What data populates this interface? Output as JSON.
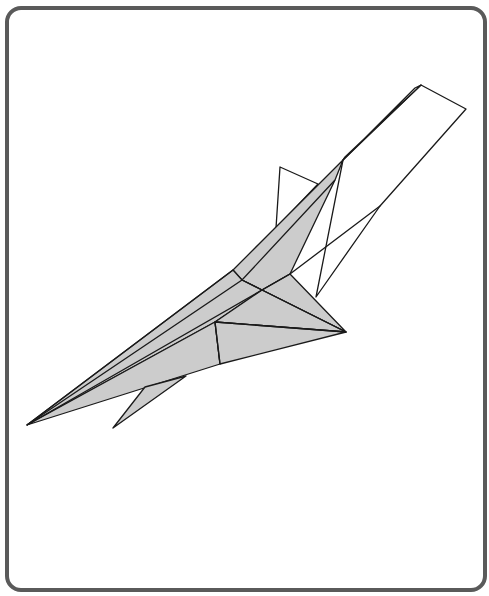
{
  "figure": {
    "type": "origami-fold-diagram",
    "colors": {
      "frame": "#5a5a5a",
      "paper_fill": "#cccccc",
      "paper_back": "#ffffff",
      "line": "#1a1a1a",
      "background": "#ffffff"
    },
    "stroke_width": 1.3,
    "shapes": [
      {
        "name": "tail-flap-outline",
        "fill": "#ffffff",
        "points": "343,160 421,85 466,109 380,206 316,297"
      },
      {
        "name": "tail-strip-inner",
        "fill": "#ffffff",
        "points": "343,160 415,88 421,85 345,157"
      },
      {
        "name": "vertical-fin",
        "fill": "#ffffff",
        "points": "280,167 318,184 276,228"
      },
      {
        "name": "lower-fin-line",
        "fill": "none",
        "points": "290,274 380,206"
      },
      {
        "name": "upper-wing",
        "fill": "#cccccc",
        "points": "343,160 335,180 290,274 262,290 242,280 233,270 275,228"
      },
      {
        "name": "body-upper",
        "fill": "#cccccc",
        "points": "233,270 242,280 262,290 215,322 27,425"
      },
      {
        "name": "rear-wing",
        "fill": "#cccccc",
        "points": "262,290 290,274 346,332 262,290"
      },
      {
        "name": "mid-panel",
        "fill": "#cccccc",
        "points": "262,290 346,332 215,322"
      },
      {
        "name": "body-lower",
        "fill": "#cccccc",
        "points": "27,425 215,322 220,364"
      },
      {
        "name": "belly-panel",
        "fill": "#cccccc",
        "points": "215,322 346,332 220,364"
      },
      {
        "name": "lower-fin",
        "fill": "#cccccc",
        "points": "145,387 186,376 113,428"
      }
    ],
    "lines": [
      {
        "name": "spine-crease",
        "points": "27,425 233,270"
      },
      {
        "name": "inner-crease-1",
        "points": "27,425 242,280 335,180"
      },
      {
        "name": "inner-crease-2",
        "points": "27,425 262,290 290,274"
      },
      {
        "name": "wing-crease",
        "points": "242,280 262,290 346,332"
      },
      {
        "name": "cross-crease",
        "points": "215,322 346,332"
      },
      {
        "name": "vertical-crease",
        "points": "215,322 220,364"
      },
      {
        "name": "tail-line",
        "points": "343,160 345,157"
      }
    ]
  }
}
